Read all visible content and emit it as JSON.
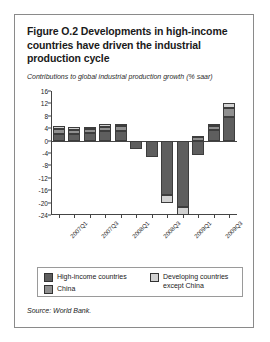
{
  "figure": {
    "title": "Figure O.2  Developments in high-income countries have driven the industrial production cycle",
    "subtitle": "Contributions to global industrial production growth (% saar)",
    "source": "Source: World Bank."
  },
  "legend": {
    "items": [
      {
        "label": "High-income countries",
        "color": "#5e5e5e"
      },
      {
        "label": "China",
        "color": "#8f8f8f"
      },
      {
        "label": "Developing countries except China",
        "color": "#d2d2d2"
      }
    ]
  },
  "colors": {
    "high_income": "#5e5e5e",
    "china": "#8f8f8f",
    "developing_ex_china": "#d2d2d2",
    "axis": "#444444",
    "box_border": "#8a8a8a",
    "text": "#1a1a1a"
  },
  "chart_data": {
    "type": "bar",
    "stacked": true,
    "title": "Contributions to global industrial production growth (% saar)",
    "xlabel": "",
    "ylabel": "",
    "ylim": [
      -24,
      16
    ],
    "yticks": [
      16,
      12,
      8,
      4,
      0,
      -4,
      -8,
      -12,
      -16,
      -20,
      -24
    ],
    "ytick_labels": [
      "16",
      "12",
      "8",
      "4",
      "0",
      "-4",
      "-8",
      "-12",
      "-16",
      "-20",
      "-24"
    ],
    "grid": false,
    "legend_position": "bottom",
    "x": [
      "2007Q1",
      "2007Q2",
      "2007Q3",
      "2007Q4",
      "2008Q1",
      "2008Q2",
      "2008Q3",
      "2008Q4",
      "2009Q1",
      "2009Q2",
      "2009Q3",
      "2009Q4"
    ],
    "xtick_labels": [
      "2007Q1",
      "2007Q3",
      "2008Q1",
      "2008Q3",
      "2009Q1",
      "2009Q3"
    ],
    "xtick_indices": [
      0,
      2,
      4,
      6,
      8,
      10
    ],
    "series": [
      {
        "name": "High-income countries",
        "color": "#5e5e5e",
        "values": [
          2.2,
          2.2,
          2.4,
          3.0,
          3.2,
          -2.6,
          -5.2,
          -17.5,
          -21.5,
          -4.5,
          3.5,
          7.5
        ]
      },
      {
        "name": "China",
        "color": "#8f8f8f",
        "values": [
          1.4,
          1.3,
          1.4,
          1.5,
          1.5,
          0.0,
          0.0,
          0.0,
          0.0,
          1.2,
          1.2,
          3.0
        ]
      },
      {
        "name": "Developing countries except China",
        "color": "#d2d2d2",
        "values": [
          1.0,
          0.8,
          0.7,
          0.8,
          0.8,
          0.0,
          0.0,
          -2.5,
          -2.6,
          0.4,
          0.8,
          1.5
        ]
      }
    ],
    "totals": [
      4.6,
      4.3,
      4.5,
      5.3,
      5.5,
      -2.6,
      -5.2,
      -20.0,
      -24.1,
      -2.9,
      5.5,
      12.0
    ]
  }
}
